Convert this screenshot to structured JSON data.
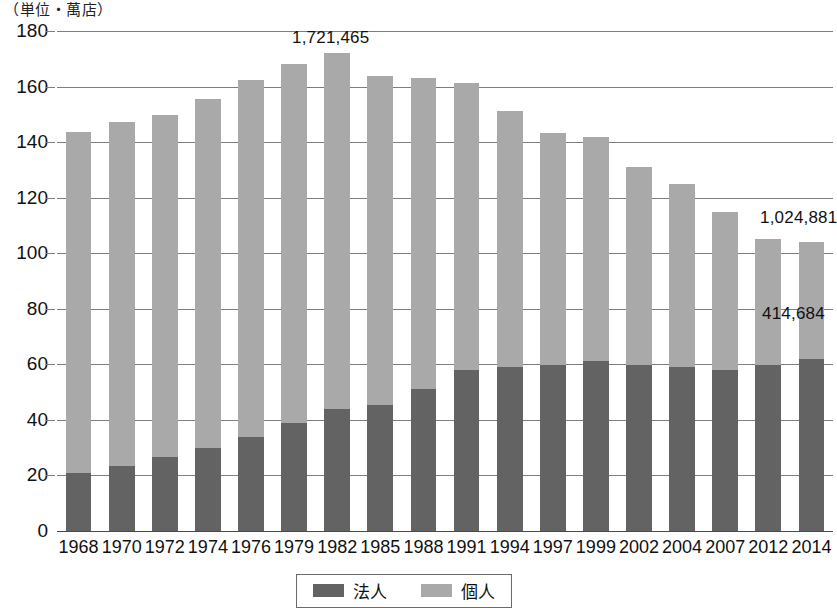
{
  "unit_caption": "（単位・萬店）",
  "annotations": {
    "peak": "1,721,465",
    "total_2014": "1,024,881",
    "hojin_2014": "414,684"
  },
  "legend": {
    "items": [
      {
        "label": "法人",
        "color": "#636363",
        "name": "legend-hojin"
      },
      {
        "label": "個人",
        "color": "#a9a9a9",
        "name": "legend-kojin"
      }
    ]
  },
  "chart_data": {
    "type": "bar",
    "subtype": "stacked-vertical",
    "title": "",
    "xlabel": "",
    "ylabel": "（単位・萬店）",
    "ylim": [
      0,
      180
    ],
    "ytick_step": 20,
    "yticks": [
      0,
      20,
      40,
      60,
      80,
      100,
      120,
      140,
      160,
      180
    ],
    "grid": true,
    "legend_position": "bottom-center",
    "categories": [
      "1968",
      "1970",
      "1972",
      "1974",
      "1976",
      "1979",
      "1982",
      "1985",
      "1988",
      "1991",
      "1994",
      "1997",
      "1999",
      "2002",
      "2004",
      "2007",
      "2012",
      "2014"
    ],
    "series": [
      {
        "name": "法人",
        "color": "#636363",
        "values": [
          21.0,
          23.5,
          26.8,
          29.8,
          33.8,
          38.8,
          44.0,
          45.3,
          51.0,
          57.8,
          59.0,
          59.6,
          61.2,
          59.6,
          59.0,
          57.8,
          59.6,
          62.0
        ]
      },
      {
        "name": "個人",
        "color": "#a9a9a9",
        "values": [
          122.5,
          123.8,
          123.0,
          125.6,
          128.4,
          129.5,
          128.2,
          118.6,
          112.2,
          103.6,
          92.3,
          83.8,
          80.6,
          71.6,
          66.1,
          57.2,
          45.4,
          41.9
        ]
      }
    ],
    "totals": [
      143.5,
      147.3,
      149.8,
      155.4,
      162.2,
      168.3,
      172.2,
      163.9,
      163.2,
      161.4,
      151.3,
      143.4,
      141.8,
      131.2,
      125.1,
      115.0,
      105.0,
      103.9
    ],
    "annotated_points": [
      {
        "category": "1982",
        "label": "1,721,465",
        "kind": "total"
      },
      {
        "category": "2014",
        "label": "1,024,881",
        "kind": "total"
      },
      {
        "category": "2014",
        "label": "414,684",
        "kind": "hojin"
      }
    ]
  }
}
